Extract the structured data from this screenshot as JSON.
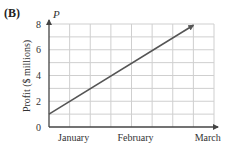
{
  "panel_label": "(B)",
  "chart_data": {
    "type": "line",
    "title": "",
    "xlabel": "",
    "ylabel": "Profit ($ millions)",
    "y_axis_symbol": "P",
    "ylim": [
      0,
      8
    ],
    "yticks": [
      0,
      2,
      4,
      6,
      8
    ],
    "x_grid_columns": 8,
    "y_grid_rows": 8,
    "grid": true,
    "x_tick_labels": [
      {
        "label": "January",
        "grid_x": 1
      },
      {
        "label": "February",
        "grid_x": 4
      },
      {
        "label": "March",
        "grid_x": 7.5
      }
    ],
    "series": [
      {
        "name": "Profit",
        "x": [
          0,
          7
        ],
        "values": [
          1,
          7.9
        ],
        "arrow_end": true,
        "color": "#555555"
      }
    ]
  },
  "colors": {
    "grid": "#cfcfcf",
    "axis": "#444444",
    "line": "#555555"
  }
}
